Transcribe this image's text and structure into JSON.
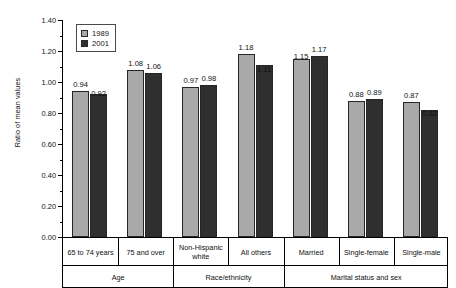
{
  "chart_data": {
    "type": "bar",
    "title": "",
    "xlabel": "",
    "ylabel": "Ratio of mean values",
    "ylim": [
      0.0,
      1.4
    ],
    "ytick_step": 0.2,
    "ytick_labels": [
      "0.00",
      "0.20",
      "0.40",
      "0.60",
      "0.80",
      "1.00",
      "1.20",
      "1.40"
    ],
    "grid": false,
    "legend_position": "top-left",
    "categories": [
      "65 to 74 years",
      "75 and over",
      "Non-Hispanic white",
      "All others",
      "Married",
      "Single-female",
      "Single-male"
    ],
    "groups": [
      {
        "label": "Age",
        "span": 2
      },
      {
        "label": "Race/ethnicity",
        "span": 2
      },
      {
        "label": "Marital status and sex",
        "span": 3
      }
    ],
    "series": [
      {
        "name": "1989",
        "color": "#a9a9a9",
        "values": [
          0.94,
          1.08,
          0.97,
          1.18,
          1.15,
          0.88,
          0.87
        ],
        "labels": [
          "0.94",
          "1.08",
          "0.97",
          "1.18",
          "1.15",
          "0.88",
          "0.87"
        ]
      },
      {
        "name": "2001",
        "color": "#2f2f2f",
        "values": [
          0.92,
          1.06,
          0.98,
          1.11,
          1.17,
          0.89,
          0.82
        ],
        "labels": [
          "0.92",
          "1.06",
          "0.98",
          "1.11",
          "1.17",
          "0.89",
          "0.82"
        ]
      }
    ]
  },
  "legend": {
    "items": [
      {
        "label": "1989",
        "swatch": "legend-swatch-1989"
      },
      {
        "label": "2001",
        "swatch": "legend-swatch-2001"
      }
    ]
  },
  "axis": {
    "y_title": "Ratio of mean values"
  }
}
